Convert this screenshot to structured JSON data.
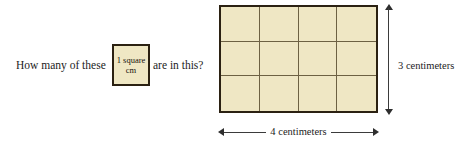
{
  "question": {
    "part1": "How many of these",
    "part2": "are in this?"
  },
  "unit_square": {
    "line1": "1 square",
    "line2": "cm"
  },
  "chart_data": {
    "type": "diagram",
    "grid": {
      "columns": 4,
      "rows": 3,
      "total_cells": 12,
      "cell_fill": "#efe7c4",
      "cell_line_color": "#6d6143",
      "border_color": "#2b2112"
    },
    "dimensions": {
      "width_label": "4 centimeters",
      "width_value": 4,
      "height_label": "3 centimeters",
      "height_value": 3,
      "unit": "centimeters"
    }
  },
  "labels": {
    "height": "3 centimeters",
    "width": "4 centimeters"
  },
  "colors": {
    "square_fill": "#efe7c4",
    "outer_border": "#2b2112",
    "inner_line": "#6d6143",
    "arrow": "#2e2e2e",
    "text": "#1c1c1c",
    "background": "#ffffff"
  }
}
